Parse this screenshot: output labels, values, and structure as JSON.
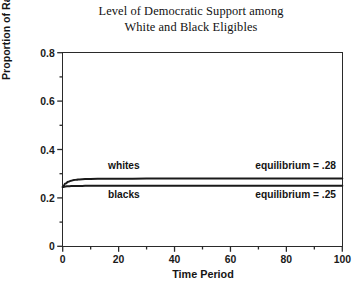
{
  "chart_data": {
    "type": "line",
    "title": "Level of Democratic Support among\nWhite and Black Eligibles",
    "title_line1": "Level of Democratic Support among",
    "title_line2": "White and Black Eligibles",
    "xlabel": "Time Period",
    "ylabel": "Proportion of Racial Group Democratic",
    "xlim": [
      0,
      100
    ],
    "ylim": [
      0,
      0.8
    ],
    "grid": false,
    "legend_position": "inline-annotations",
    "xticks": [
      0,
      20,
      40,
      60,
      80,
      100
    ],
    "xtick_labels": [
      "0",
      "20",
      "40",
      "60",
      "80",
      "100"
    ],
    "xminor_ticks": [
      10,
      30,
      50,
      70,
      90
    ],
    "yticks": [
      0,
      0.2,
      0.4,
      0.6,
      0.8
    ],
    "ytick_labels": [
      "0",
      "0.2",
      "0.4",
      "0.6",
      "0.8"
    ],
    "yminor_ticks": [
      0.1,
      0.3,
      0.5,
      0.7
    ],
    "x": [
      0,
      1,
      2,
      3,
      4,
      5,
      6,
      8,
      10,
      15,
      20,
      30,
      40,
      50,
      60,
      70,
      80,
      90,
      100
    ],
    "series": [
      {
        "name": "whites",
        "label": "whites",
        "equilibrium": 0.28,
        "equilibrium_text": "equilibrium = .28",
        "color": "#1a1a1a",
        "values": [
          0.245,
          0.259,
          0.267,
          0.271,
          0.274,
          0.275,
          0.2765,
          0.2777,
          0.2783,
          0.2792,
          0.2795,
          0.2797,
          0.2798,
          0.2799,
          0.2799,
          0.28,
          0.28,
          0.28,
          0.28
        ]
      },
      {
        "name": "blacks",
        "label": "blacks",
        "equilibrium": 0.25,
        "equilibrium_text": "equilibrium = .25",
        "color": "#1a1a1a",
        "values": [
          0.245,
          0.2472,
          0.2483,
          0.2489,
          0.2492,
          0.2494,
          0.2496,
          0.2497,
          0.2498,
          0.2499,
          0.24995,
          0.25,
          0.25,
          0.25,
          0.25,
          0.25,
          0.25,
          0.25,
          0.25
        ]
      }
    ],
    "annotations": [
      {
        "text": "whites",
        "kind": "series-label",
        "series": "whites"
      },
      {
        "text": "blacks",
        "kind": "series-label",
        "series": "blacks"
      },
      {
        "text": "equilibrium = .28",
        "kind": "equilibrium-label",
        "series": "whites"
      },
      {
        "text": "equilibrium = .25",
        "kind": "equilibrium-label",
        "series": "blacks"
      }
    ]
  }
}
